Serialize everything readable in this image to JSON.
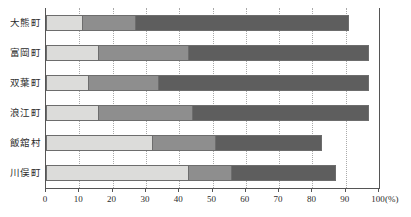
{
  "chart_data": {
    "type": "bar",
    "orientation": "horizontal",
    "stacked": true,
    "stacked_mode": "cumulative_percent",
    "title": "",
    "subtitle": "",
    "xlabel": "",
    "ylabel": "",
    "axis_unit": "(%)",
    "xlim": [
      0,
      100
    ],
    "xticks": [
      0,
      10,
      20,
      30,
      40,
      50,
      60,
      70,
      80,
      90,
      100
    ],
    "xticklabels": [
      "0",
      "10",
      "20",
      "30",
      "40",
      "50",
      "60",
      "70",
      "80",
      "90",
      "100"
    ],
    "grid": true,
    "grid_axis": "x",
    "grid_style": "dotted",
    "legend": false,
    "legend_position": "none",
    "categories": [
      "大熊町",
      "富岡町",
      "双葉町",
      "浪江町",
      "飯舘村",
      "川俣町"
    ],
    "series": [
      {
        "name": "segment-1",
        "color": "#dcdcda",
        "values": [
          11,
          16,
          13,
          16,
          32,
          43
        ]
      },
      {
        "name": "segment-2",
        "color": "#8e8e8e",
        "values": [
          16,
          27,
          21,
          28,
          19,
          13
        ]
      },
      {
        "name": "segment-3",
        "color": "#5e5e5e",
        "values": [
          64,
          54,
          63,
          53,
          32,
          31
        ]
      }
    ],
    "cumulative": [
      {
        "category": "大熊町",
        "boundaries": [
          11,
          27,
          91
        ]
      },
      {
        "category": "富岡町",
        "boundaries": [
          16,
          43,
          97
        ]
      },
      {
        "category": "双葉町",
        "boundaries": [
          13,
          34,
          97
        ]
      },
      {
        "category": "浪江町",
        "boundaries": [
          16,
          44,
          97
        ]
      },
      {
        "category": "飯舘村",
        "boundaries": [
          32,
          51,
          83
        ]
      },
      {
        "category": "川俣町",
        "boundaries": [
          43,
          56,
          87
        ]
      }
    ]
  },
  "colors": {
    "segment_1": "#dcdcda",
    "segment_2": "#8e8e8e",
    "segment_3": "#5e5e5e",
    "axis": "#555555",
    "grid": "#aaaaaa",
    "text": "#2b2b2b",
    "background": "#ffffff"
  }
}
